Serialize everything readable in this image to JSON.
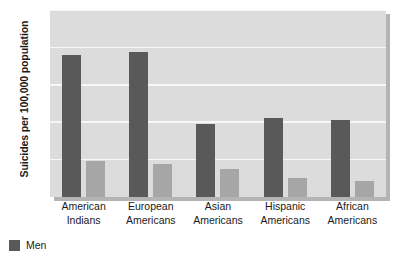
{
  "chart_data": {
    "type": "bar",
    "title": "",
    "xlabel": "",
    "ylabel": "Suicides per 100,000 population",
    "categories": [
      "American Indians",
      "European Americans",
      "Asian Americans",
      "Hispanic Americans",
      "African Americans"
    ],
    "category_lines": [
      [
        "American",
        "Indians"
      ],
      [
        "European",
        "Americans"
      ],
      [
        "Asian",
        "Americans"
      ],
      [
        "Hispanic",
        "Americans"
      ],
      [
        "African",
        "Americans"
      ]
    ],
    "series": [
      {
        "name": "Men",
        "color": "#595959",
        "values": [
          19.0,
          19.4,
          9.8,
          10.6,
          10.3
        ]
      },
      {
        "name": "Women",
        "color": "#a6a6a6",
        "values": [
          4.8,
          4.4,
          3.8,
          2.5,
          2.2
        ]
      }
    ],
    "ylim": [
      0,
      25
    ],
    "yticks": [
      5,
      10,
      15,
      20,
      25
    ],
    "ytick_labels": [
      "5",
      "10",
      "15",
      "20",
      "25"
    ],
    "grid": true,
    "grid_color": "#f7f7f7",
    "plot_background": "#dcdcdc",
    "legend_position": "bottom-left",
    "legend_visible_entries": [
      {
        "label": "Men",
        "color": "#595959"
      }
    ]
  }
}
